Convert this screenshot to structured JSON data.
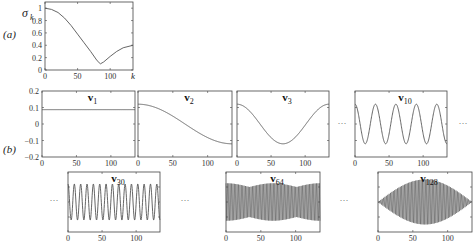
{
  "figure": {
    "panel_a_label": "(a)",
    "panel_b_label": "(b)",
    "ellipsis": "···"
  },
  "chart_data": [
    {
      "type": "line",
      "id": "sigma",
      "title": "",
      "ylabel": "σ_k",
      "xlabel": "k",
      "xlim": [
        0,
        135
      ],
      "ylim": [
        0,
        1.1
      ],
      "xticks": [
        0,
        50,
        100
      ],
      "yticks": [
        0,
        0.2,
        0.4,
        0.6,
        0.8,
        1
      ],
      "x": [
        0,
        10,
        20,
        30,
        40,
        50,
        60,
        70,
        80,
        85,
        90,
        100,
        110,
        120,
        135
      ],
      "values": [
        1.0,
        0.98,
        0.93,
        0.84,
        0.72,
        0.58,
        0.44,
        0.3,
        0.15,
        0.1,
        0.13,
        0.22,
        0.3,
        0.36,
        0.4
      ]
    },
    {
      "type": "line",
      "id": "v1",
      "title": "v1",
      "xlim": [
        0,
        135
      ],
      "ylim": [
        -0.2,
        0.2
      ],
      "xticks": [
        0,
        50,
        100
      ],
      "yticks": [
        -0.2,
        -0.1,
        0,
        0.1,
        0.2
      ],
      "description": "constant ≈ 0.087"
    },
    {
      "type": "line",
      "id": "v2",
      "title": "v2",
      "xlim": [
        0,
        135
      ],
      "ylim": [
        -0.2,
        0.2
      ],
      "xticks": [
        0,
        50,
        100
      ],
      "description": "half cosine from ≈0.12 to ≈-0.12"
    },
    {
      "type": "line",
      "id": "v3",
      "title": "v3",
      "xlim": [
        0,
        135
      ],
      "ylim": [
        -0.2,
        0.2
      ],
      "xticks": [
        0,
        50,
        100
      ],
      "description": "full cosine, min ≈-0.12 at x≈67"
    },
    {
      "type": "line",
      "id": "v10",
      "title": "v10",
      "xlim": [
        0,
        135
      ],
      "ylim": [
        -0.2,
        0.2
      ],
      "xticks": [
        0,
        50,
        100
      ],
      "description": "cosine, ~4.5 periods, amplitude ≈0.12"
    },
    {
      "type": "line",
      "id": "v30",
      "title": "v30",
      "xlim": [
        0,
        135
      ],
      "ylim": [
        -0.2,
        0.2
      ],
      "xticks": [
        0,
        50,
        100
      ],
      "description": "cosine, ~14.5 periods"
    },
    {
      "type": "line",
      "id": "v64",
      "title": "v64",
      "xlim": [
        0,
        135
      ],
      "ylim": [
        -0.2,
        0.2
      ],
      "xticks": [
        0,
        50,
        100
      ],
      "description": "high-frequency oscillation with beating envelope"
    },
    {
      "type": "line",
      "id": "v128",
      "title": "v128",
      "xlim": [
        0,
        135
      ],
      "ylim": [
        -0.2,
        0.2
      ],
      "xticks": [
        0,
        50,
        100
      ],
      "description": "Nyquist-frequency oscillation with half-sine envelope"
    }
  ],
  "labels": {
    "sigma_y": "σ",
    "sigma_sub": "k",
    "k": "k",
    "v_prefix": "v",
    "v1": "1",
    "v2": "2",
    "v3": "3",
    "v10": "10",
    "v30": "30",
    "v64": "64",
    "v128": "128"
  },
  "ticks": {
    "x": [
      "0",
      "50",
      "100"
    ],
    "a_y": [
      "0",
      "0.2",
      "0.4",
      "0.6",
      "0.8",
      "1"
    ],
    "b_y": [
      "0.2",
      "0.1",
      "0",
      "−0.1",
      "−0.2"
    ]
  }
}
